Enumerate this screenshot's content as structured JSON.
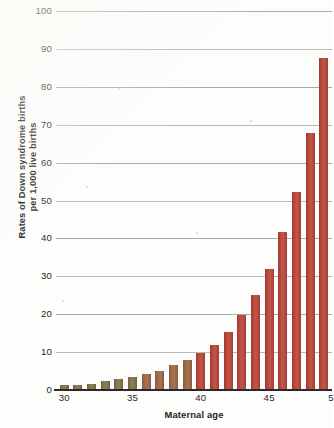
{
  "chart_data": {
    "type": "bar",
    "title": "",
    "subtitle": "",
    "xlabel": "Maternal age",
    "ylabel": "Rates of Down syndrome births per 1,000 live births",
    "ylabel_lines": [
      "Rates of Down syndrome births",
      "per 1,000 live births"
    ],
    "xlim": [
      29.4,
      49.6
    ],
    "ylim": [
      0,
      100
    ],
    "ytick_labels": [
      "0",
      "10",
      "20",
      "30",
      "40",
      "50",
      "60",
      "70",
      "80",
      "90",
      "100"
    ],
    "ytick_values": [
      0,
      10,
      20,
      30,
      40,
      50,
      60,
      70,
      80,
      90,
      100
    ],
    "xtick_labels": [
      "30",
      "35",
      "40",
      "45",
      "5"
    ],
    "xtick_values": [
      30,
      35,
      40,
      45,
      50
    ],
    "grid": "horizontal",
    "legend": "none",
    "bar_color": "#b4463a",
    "bar_color_low": "#8d7d58",
    "categories": [
      30,
      31,
      32,
      33,
      34,
      35,
      36,
      37,
      38,
      39,
      40,
      41,
      42,
      43,
      44,
      45,
      46,
      47,
      48,
      49
    ],
    "values": [
      1.2,
      1.4,
      1.5,
      2.3,
      2.8,
      3.5,
      4.3,
      5.1,
      6.5,
      8.0,
      9.8,
      11.8,
      15.3,
      19.7,
      25.0,
      32.0,
      41.6,
      52.2,
      67.8,
      87.5
    ],
    "series": [
      {
        "name": "Rates of Down syndrome births per 1,000 live births",
        "values": [
          1.2,
          1.4,
          1.5,
          2.3,
          2.8,
          3.5,
          4.3,
          5.1,
          6.5,
          8.0,
          9.8,
          11.8,
          15.3,
          19.7,
          25.0,
          32.0,
          41.6,
          52.2,
          67.8,
          87.5
        ]
      }
    ],
    "annotations": []
  }
}
